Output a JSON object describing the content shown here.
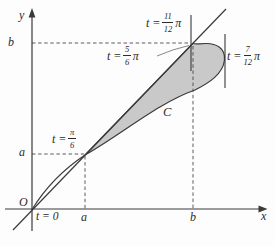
{
  "colors": {
    "shade": "#c9c9c9",
    "stroke": "#3a3a3a",
    "background": "#fdfdfd"
  },
  "axes": {
    "y_label": "y",
    "x_label": "x",
    "origin_label": "O",
    "ticks": {
      "y_b": "b",
      "y_a": "a",
      "x_a": "a",
      "x_b": "b"
    }
  },
  "curve": {
    "label": "C"
  },
  "param_labels": {
    "t0": "t = 0",
    "t_pi_6": {
      "prefix": "t =",
      "num": "π",
      "den": "6",
      "suffix": ""
    },
    "t_5pi_6": {
      "prefix": "t =",
      "num": "5",
      "den": "6",
      "suffix": "π"
    },
    "t_11pi_12": {
      "prefix": "t =",
      "num": "11",
      "den": "12",
      "suffix": "π"
    },
    "t_7pi_12": {
      "prefix": "t =",
      "num": "7",
      "den": "12",
      "suffix": "π"
    }
  }
}
